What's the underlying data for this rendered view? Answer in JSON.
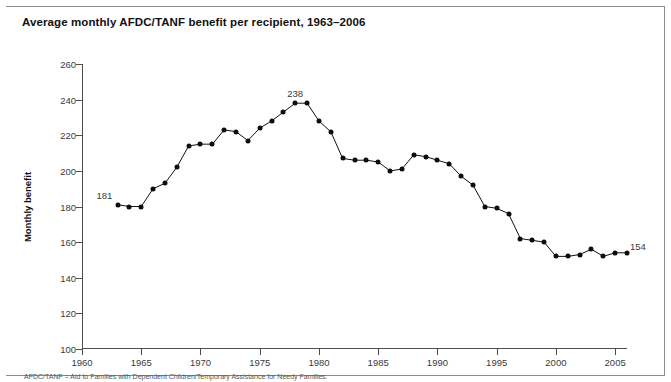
{
  "figure": {
    "title": "Average monthly AFDC/TANF benefit per recipient, 1963–2006",
    "footnote": "AFDC/TANF = Aid to Families with Dependent Children/Temporary Assistance for Needy Families."
  },
  "chart_data": {
    "type": "line",
    "title": "Average monthly AFDC/TANF benefit per recipient, 1963–2006",
    "xlabel": "",
    "ylabel": "Monthly benefit",
    "xlim": [
      1960,
      2006
    ],
    "ylim": [
      100,
      260
    ],
    "xticks": [
      1960,
      1965,
      1970,
      1975,
      1980,
      1985,
      1990,
      1995,
      2000,
      2005
    ],
    "yticks": [
      100,
      120,
      140,
      160,
      180,
      200,
      220,
      240,
      260
    ],
    "grid": false,
    "legend": false,
    "marker": "filled-circle",
    "line_color": "#111111",
    "x": [
      1963,
      1964,
      1965,
      1966,
      1967,
      1968,
      1969,
      1970,
      1971,
      1972,
      1973,
      1974,
      1975,
      1976,
      1977,
      1978,
      1979,
      1980,
      1981,
      1982,
      1983,
      1984,
      1985,
      1986,
      1987,
      1988,
      1989,
      1990,
      1991,
      1992,
      1993,
      1994,
      1995,
      1996,
      1997,
      1998,
      1999,
      2000,
      2001,
      2002,
      2003,
      2004,
      2005,
      2006
    ],
    "values": [
      181,
      180,
      180,
      190,
      193,
      202,
      214,
      215,
      215,
      223,
      222,
      217,
      224,
      228,
      233,
      238,
      238,
      228,
      222,
      207,
      206,
      206,
      205,
      200,
      201,
      209,
      208,
      206,
      204,
      197,
      192,
      180,
      179,
      176,
      162,
      161,
      160,
      152,
      152,
      153,
      156,
      152,
      154,
      154
    ],
    "annotations": [
      {
        "x": 1963,
        "y": 181,
        "text": "181",
        "position": "above-left"
      },
      {
        "x": 1978,
        "y": 238,
        "text": "238",
        "position": "above"
      },
      {
        "x": 2006,
        "y": 154,
        "text": "154",
        "position": "above-right"
      }
    ]
  }
}
